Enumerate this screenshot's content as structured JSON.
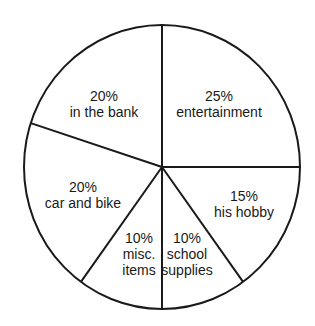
{
  "chart_data": {
    "type": "pie",
    "title": "",
    "start_angle_deg": 0,
    "direction": "clockwise",
    "slices": [
      {
        "label": "entertainment",
        "value": 25,
        "display": "25%"
      },
      {
        "label": "his hobby",
        "value": 15,
        "display": "15%"
      },
      {
        "label": "school supplies",
        "value": 10,
        "display": "10%"
      },
      {
        "label": "misc. items",
        "value": 10,
        "display": "10%"
      },
      {
        "label": "car and bike",
        "value": 20,
        "display": "20%"
      },
      {
        "label": "in the bank",
        "value": 20,
        "display": "20%"
      }
    ],
    "categories": [
      "entertainment",
      "his hobby",
      "school supplies",
      "misc. items",
      "car and bike",
      "in the bank"
    ],
    "values": [
      25,
      15,
      10,
      10,
      20,
      20
    ],
    "legend": "none (labels inside slices)"
  },
  "labels": [
    {
      "lines": [
        "25%",
        "entertainment"
      ],
      "x": 219,
      "y": 101
    },
    {
      "lines": [
        "15%",
        "his hobby"
      ],
      "x": 244,
      "y": 201
    },
    {
      "lines": [
        "10%",
        "school",
        "supplies"
      ],
      "x": 187,
      "y": 243
    },
    {
      "lines": [
        "10%",
        "misc.",
        "items"
      ],
      "x": 139,
      "y": 243
    },
    {
      "lines": [
        "20%",
        "car and bike"
      ],
      "x": 83,
      "y": 192
    },
    {
      "lines": [
        "20%",
        "in the bank"
      ],
      "x": 104,
      "y": 101
    }
  ],
  "style": {
    "stroke": "#1a1a1a",
    "fill": "#ffffff"
  }
}
